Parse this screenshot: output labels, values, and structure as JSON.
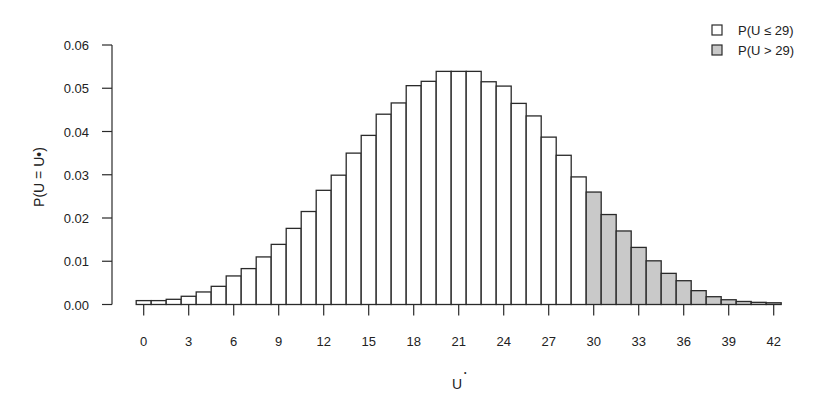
{
  "chart_data": {
    "type": "bar",
    "title": "",
    "xlabel": "U*",
    "ylabel": "P(U = U*)",
    "ylim": [
      0,
      0.06
    ],
    "xlim": [
      0,
      42
    ],
    "grid": false,
    "legend_position": "top-right",
    "x": [
      0,
      1,
      2,
      3,
      4,
      5,
      6,
      7,
      8,
      9,
      10,
      11,
      12,
      13,
      14,
      15,
      16,
      17,
      18,
      19,
      20,
      21,
      22,
      23,
      24,
      25,
      26,
      27,
      28,
      29,
      30,
      31,
      32,
      33,
      34,
      35,
      36,
      37,
      38,
      39,
      40,
      41,
      42
    ],
    "values": [
      0.0009,
      0.0009,
      0.0012,
      0.0019,
      0.0029,
      0.0042,
      0.0066,
      0.0083,
      0.011,
      0.0139,
      0.0176,
      0.0215,
      0.0264,
      0.0299,
      0.035,
      0.0391,
      0.044,
      0.0466,
      0.0506,
      0.0516,
      0.0539,
      0.0539,
      0.0539,
      0.0515,
      0.0505,
      0.0465,
      0.0436,
      0.0387,
      0.0345,
      0.0295,
      0.026,
      0.0208,
      0.017,
      0.0132,
      0.0101,
      0.0072,
      0.0055,
      0.0032,
      0.0018,
      0.0011,
      0.0007,
      0.0005,
      0.0004
    ],
    "threshold": 29,
    "series": [
      {
        "name": "P(U ≤ 29)",
        "range": [
          0,
          29
        ],
        "fill": "#ffffff"
      },
      {
        "name": "P(U > 29)",
        "range": [
          30,
          42
        ],
        "fill": "#c9c9c9"
      }
    ],
    "xticks": [
      0,
      3,
      6,
      9,
      12,
      15,
      18,
      21,
      24,
      27,
      30,
      33,
      36,
      39,
      42
    ],
    "yticks": [
      "0.00",
      "0.01",
      "0.02",
      "0.03",
      "0.04",
      "0.05",
      "0.06"
    ]
  },
  "legend": {
    "items": [
      {
        "label": "P(U ≤ 29)",
        "fill": "#ffffff"
      },
      {
        "label": "P(U > 29)",
        "fill": "#c9c9c9"
      }
    ]
  },
  "axes": {
    "xlabel_main": "U",
    "xlabel_sup": "•",
    "ylabel": "P(U = U•)"
  },
  "colors": {
    "stroke": "#2a2a2a",
    "low_fill": "#ffffff",
    "high_fill": "#c9c9c9"
  }
}
